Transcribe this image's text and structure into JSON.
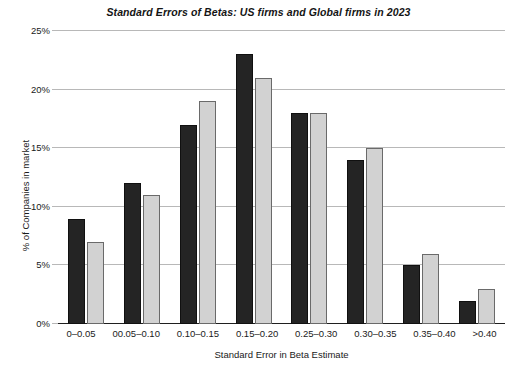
{
  "chart_data": {
    "type": "bar",
    "title": "Standard Errors of Betas: US firms and Global firms in 2023",
    "xlabel": "Standard Error in Beta Estimate",
    "ylabel": "% of Companies in market",
    "categories": [
      "0–0.05",
      "00.05–0.10",
      "0.10–0.15",
      "0.15–0.20",
      "0.25–0.30",
      "0.30–0.35",
      "0.35–0.40",
      ">0.40"
    ],
    "series": [
      {
        "name": "US firms",
        "color": "#242424",
        "values": [
          9,
          12,
          17,
          23,
          18,
          14,
          5,
          2
        ]
      },
      {
        "name": "Global firms",
        "color": "#d2d2d2",
        "values": [
          7,
          11,
          19,
          21,
          18,
          15,
          6,
          3
        ]
      }
    ],
    "ylim": [
      0,
      25
    ],
    "y_ticks": [
      0,
      5,
      10,
      15,
      20,
      25
    ],
    "y_tick_labels": [
      "0%",
      "5%",
      "10%",
      "15%",
      "20%",
      "25%"
    ],
    "grid": true,
    "legend": "none",
    "value_suffix": "%"
  }
}
